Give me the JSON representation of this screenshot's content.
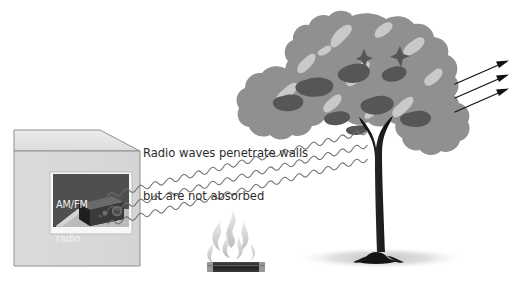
{
  "figure": {
    "background_color": "#ffffff"
  },
  "caption": {
    "line1": "Radio waves penetrate walls",
    "line2": "but are not absorbed",
    "color": "#2c2c2c"
  },
  "room_box": {
    "name": "room-box",
    "face_color": "#d9d9d9",
    "top_color": "#e3e3e3",
    "edge_color": "#8c8c8c"
  },
  "radio_panel": {
    "label_line1": "AM/FM",
    "label_line2": "radio",
    "panel_color": "#4a4a4a",
    "text_color": "#f2f2f2",
    "frame_color": "#f7f7f7"
  },
  "fire": {
    "name": "campfire",
    "flame_color": "#d8d8d8",
    "base_color": "#2b2b2b"
  },
  "tree": {
    "name": "tree",
    "canopy_color": "#909090",
    "canopy_highlight": "#c9c9c9",
    "canopy_shadow": "#565656",
    "trunk_color": "#1c1c1c",
    "ground_shadow_color": "#d6d6d6"
  },
  "waves": {
    "name": "radio-waves",
    "count": 3,
    "stroke_color": "#6e6e6e",
    "arrow_color": "#111111",
    "direction": "left-to-right, angled upward",
    "arrowheads": 3
  }
}
